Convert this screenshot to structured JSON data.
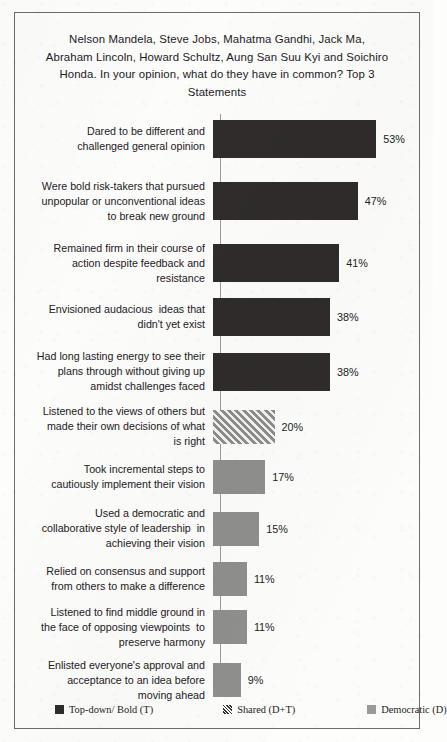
{
  "chart_data": {
    "type": "bar",
    "orientation": "horizontal",
    "title": "Nelson Mandela, Steve Jobs, Mahatma Gandhi, Jack Ma, Abraham Lincoln, Howard Schultz, Aung San Suu Kyi and Soichiro Honda. In your opinion, what do they have in common? Top 3 Statements",
    "xlabel": "",
    "ylabel": "",
    "xlim": [
      0,
      60
    ],
    "grid": false,
    "value_suffix": "%",
    "legend_position": "bottom",
    "categories": [
      "Dared to be different and challenged general opinion",
      "Were bold risk-takers that pursued unpopular or unconventional ideas to break new ground",
      "Remained firm in their course of action despite feedback and resistance",
      "Envisioned audacious  ideas that didn't yet exist",
      "Had long lasting energy to see their plans through without giving up amidst challenges faced",
      "Listened to the views of others but made their own decisions of what is right",
      "Took incremental steps to cautiously implement their vision",
      "Used a democratic and collaborative style of leadership  in achieving their vision",
      "Relied on consensus and support from others to make a difference",
      "Listened to find middle ground in the face of opposing viewpoints  to preserve harmony",
      "Enlisted everyone's approval and acceptance to an idea before moving ahead"
    ],
    "values": [
      53,
      47,
      41,
      38,
      38,
      20,
      17,
      15,
      11,
      11,
      9
    ],
    "value_labels": [
      "53%",
      "47%",
      "41%",
      "38%",
      "38%",
      "20%",
      "17%",
      "15%",
      "11%",
      "11%",
      "9%"
    ],
    "series_of_bar": [
      "topdown",
      "topdown",
      "topdown",
      "topdown",
      "topdown",
      "shared",
      "democratic",
      "democratic",
      "democratic",
      "democratic",
      "democratic"
    ],
    "series": [
      {
        "name": "Top-down/ Bold (T)",
        "key": "topdown",
        "color": "#2f2c2b",
        "pattern": "solid"
      },
      {
        "name": "Shared (D+T)",
        "key": "shared",
        "color": "#8d8d8b",
        "pattern": "diagonal-hatch"
      },
      {
        "name": "Democratic (D)",
        "key": "democratic",
        "color": "#8f8f8d",
        "pattern": "solid"
      }
    ]
  },
  "bars": [
    {
      "label": "Dared to be different and\nchallenged general opinion",
      "value_label": "53%",
      "value": 53,
      "series": "topdown"
    },
    {
      "label": "Were bold risk-takers that pursued\nunpopular or unconventional ideas\nto break new ground",
      "value_label": "47%",
      "value": 47,
      "series": "topdown"
    },
    {
      "label": "Remained firm in their course of\naction despite feedback and\nresistance",
      "value_label": "41%",
      "value": 41,
      "series": "topdown"
    },
    {
      "label": "Envisioned audacious  ideas that\ndidn't yet exist",
      "value_label": "38%",
      "value": 38,
      "series": "topdown"
    },
    {
      "label": "Had long lasting energy to see their\nplans through without giving up\namidst challenges faced",
      "value_label": "38%",
      "value": 38,
      "series": "topdown"
    },
    {
      "label": "Listened to the views of others but\nmade their own decisions of what\nis right",
      "value_label": "20%",
      "value": 20,
      "series": "shared"
    },
    {
      "label": "Took incremental steps to\ncautiously implement their vision",
      "value_label": "17%",
      "value": 17,
      "series": "democratic"
    },
    {
      "label": "Used a democratic and\ncollaborative style of leadership  in\nachieving their vision",
      "value_label": "15%",
      "value": 15,
      "series": "democratic"
    },
    {
      "label": "Relied on consensus and support\nfrom others to make a difference",
      "value_label": "11%",
      "value": 11,
      "series": "democratic"
    },
    {
      "label": "Listened to find middle ground in\nthe face of opposing viewpoints  to\npreserve harmony",
      "value_label": "11%",
      "value": 11,
      "series": "democratic"
    },
    {
      "label": "Enlisted everyone's approval and\nacceptance to an idea before\nmoving ahead",
      "value_label": "9%",
      "value": 9,
      "series": "democratic"
    }
  ],
  "legend": [
    {
      "label": "Top-down/ Bold (T)",
      "swatch": "topdown"
    },
    {
      "label": "Shared (D+T)",
      "swatch": "shared"
    },
    {
      "label": "Democratic (D)",
      "swatch": "democratic"
    }
  ]
}
